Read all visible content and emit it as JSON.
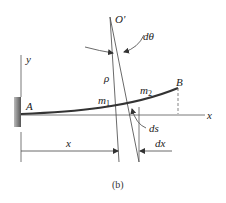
{
  "figure": {
    "caption": "(b)",
    "labels": {
      "center": "O'",
      "angle": "dθ",
      "radius": "ρ",
      "y_axis": "y",
      "x_axis": "x",
      "fixed_end": "A",
      "free_end": "B",
      "point1": "m",
      "point1_sub": "1",
      "point2": "m",
      "point2_sub": "2",
      "arc_length": "ds",
      "distance": "x",
      "increment": "dx"
    },
    "colors": {
      "line": "#444444",
      "beam": "#333333",
      "wall": "#666666"
    }
  }
}
